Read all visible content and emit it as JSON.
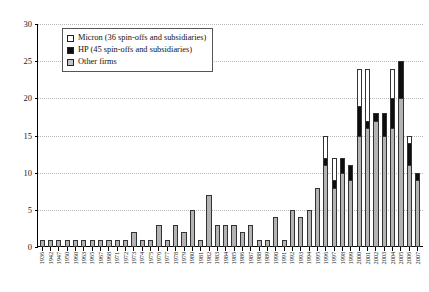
{
  "chart_data": {
    "type": "bar",
    "title": "",
    "subtitle": "",
    "xlabel": "",
    "ylabel": "",
    "ylim": [
      0,
      30
    ],
    "yticks": [
      0,
      5,
      10,
      15,
      20,
      25,
      30
    ],
    "grid": true,
    "stacked": true,
    "legend_position": "top-left",
    "legend": [
      {
        "name": "Micron (36 spin-offs and subsidiaries)",
        "color": "#ffffff"
      },
      {
        "name": "HP (45 spin-offs and subsidiaries)",
        "color": "#0d0d0d"
      },
      {
        "name": "Other firms",
        "color": "#b3b3b3"
      }
    ],
    "categories": [
      "1936",
      "1942",
      "1947",
      "1950",
      "1960",
      "1963",
      "1965",
      "1967",
      "1968",
      "1971",
      "1972",
      "1973",
      "1974",
      "1975",
      "1976",
      "1977",
      "1978",
      "1979",
      "1980",
      "1981",
      "1982",
      "1983",
      "1984",
      "1985",
      "1986",
      "1987",
      "1988",
      "1989",
      "1990",
      "1991",
      "1992",
      "1993",
      "1994",
      "1995",
      "1996",
      "1997",
      "1998",
      "1999",
      "2000",
      "2001",
      "2002",
      "2003",
      "2004",
      "2005",
      "2006",
      "2007"
    ],
    "series": [
      {
        "name": "Other firms",
        "color": "#b3b3b3",
        "values": [
          1,
          1,
          1,
          1,
          1,
          1,
          1,
          1,
          1,
          1,
          1,
          2,
          1,
          1,
          3,
          1,
          3,
          2,
          5,
          1,
          7,
          3,
          3,
          3,
          2,
          3,
          1,
          1,
          4,
          1,
          5,
          4,
          5,
          8,
          11,
          8,
          10,
          9,
          15,
          16,
          17,
          15,
          16,
          20,
          11,
          9
        ]
      },
      {
        "name": "HP (45 spin-offs and subsidiaries)",
        "color": "#0d0d0d",
        "values": [
          0,
          0,
          0,
          0,
          0,
          0,
          0,
          0,
          0,
          0,
          0,
          0,
          0,
          0,
          0,
          0,
          0,
          0,
          0,
          0,
          0,
          0,
          0,
          0,
          0,
          0,
          0,
          0,
          0,
          0,
          0,
          0,
          0,
          0,
          1,
          1,
          2,
          2,
          4,
          1,
          1,
          3,
          4,
          5,
          3,
          1
        ]
      },
      {
        "name": "Micron (36 spin-offs and subsidiaries)",
        "color": "#ffffff",
        "values": [
          0,
          0,
          0,
          0,
          0,
          0,
          0,
          0,
          0,
          0,
          0,
          0,
          0,
          0,
          0,
          0,
          0,
          0,
          0,
          0,
          0,
          0,
          0,
          0,
          0,
          0,
          0,
          0,
          0,
          0,
          0,
          0,
          0,
          0,
          3,
          3,
          0,
          0,
          5,
          7,
          0,
          0,
          4,
          0,
          1,
          0
        ]
      }
    ],
    "totals": [
      1,
      1,
      1,
      1,
      1,
      1,
      1,
      1,
      1,
      1,
      1,
      2,
      1,
      1,
      3,
      1,
      3,
      2,
      5,
      1,
      7,
      3,
      3,
      3,
      2,
      3,
      1,
      1,
      4,
      1,
      5,
      4,
      5,
      8,
      15,
      12,
      12,
      11,
      24,
      24,
      18,
      18,
      24,
      25,
      15,
      10
    ]
  }
}
